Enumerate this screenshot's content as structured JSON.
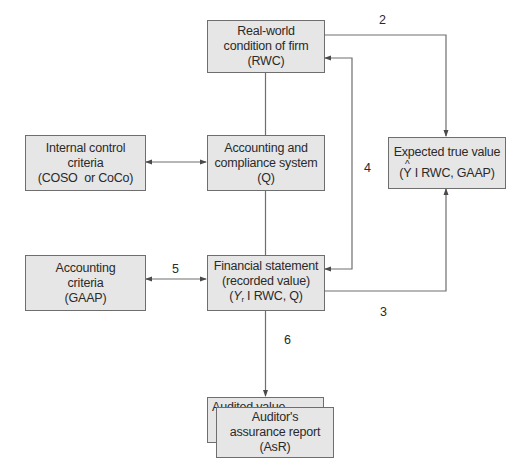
{
  "diagram": {
    "type": "flowchart",
    "colors": {
      "box_fill": "#e6e6e6",
      "box_border": "#6e6e6e",
      "line": "#6e6e6e",
      "text": "#2a2a2a"
    },
    "nodes": {
      "rwc": {
        "line1": "Real-world",
        "line2": "condition of firm",
        "line3": "(RWC)"
      },
      "internal_control": {
        "line1": "Internal control",
        "line2": "criteria",
        "line3": "(COSO  or CoCo)"
      },
      "accounting_system": {
        "line1": "Accounting and",
        "line2": "compliance system",
        "line3": "(Q)"
      },
      "expected_value": {
        "line1": "Expected true value",
        "line3_prefix": "(",
        "y_hat": "Y",
        "line3_suffix": " I RWC, GAAP)"
      },
      "accounting_criteria": {
        "line1": "Accounting",
        "line2": "criteria",
        "line3": "(GAAP)"
      },
      "financial_statement": {
        "line1": "Financial statement",
        "line2": "(recorded value)",
        "line3_prefix": "(",
        "y": "Y",
        "y_sub": "r",
        "line3_suffix": " I RWC, Q)"
      },
      "audited_value": {
        "line1": "Audited value",
        "line2_prefix": "(",
        "y": "Y",
        "y_sub": "a",
        "line2_suffix": ")"
      },
      "assurance_report": {
        "line1": "Auditor's",
        "line2": "assurance report",
        "line3": "(AsR)"
      }
    },
    "edges": [
      {
        "label": "1",
        "from": "internal_control",
        "to": "accounting_system",
        "direction": "both"
      },
      {
        "label": "2",
        "from": "rwc",
        "to": "expected_value",
        "direction": "forward"
      },
      {
        "label": "3",
        "from": "financial_statement",
        "to": "expected_value",
        "direction": "forward"
      },
      {
        "label": "4",
        "from": "financial_statement",
        "to": "rwc",
        "direction": "both"
      },
      {
        "label": "5",
        "from": "accounting_criteria",
        "to": "financial_statement",
        "direction": "both"
      },
      {
        "label": "6",
        "from": "financial_statement",
        "to": "audited_value",
        "direction": "forward"
      },
      {
        "label": "",
        "from": "rwc",
        "to": "accounting_system",
        "direction": "none"
      },
      {
        "label": "",
        "from": "accounting_system",
        "to": "financial_statement",
        "direction": "none"
      }
    ]
  }
}
